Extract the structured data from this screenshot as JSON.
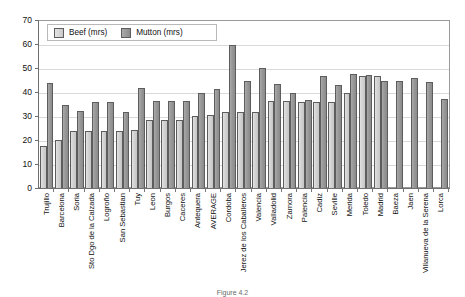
{
  "chart_data": {
    "type": "bar",
    "title": "",
    "subtitle": "",
    "xlabel": "",
    "ylabel": "",
    "ylim": [
      0,
      70
    ],
    "ytick_step": 10,
    "yticks": [
      70,
      60,
      50,
      40,
      30,
      20,
      10,
      0
    ],
    "grid": true,
    "legend_position": "top-left inside plot",
    "categories": [
      "Trujillo",
      "Barcelona",
      "Soria",
      "Sto Dgo de la Calzada",
      "Logroño",
      "San Sebastian",
      "Tuy",
      "Leon",
      "Burgos",
      "Caceres",
      "Antequera",
      "AVERAGE",
      "Cordoba",
      "Jerez de los Caballeros",
      "Valencia",
      "Valladolid",
      "Zamora",
      "Palencia",
      "Cadiz",
      "Seville",
      "Merida",
      "Toledo",
      "Madrid",
      "Baeza",
      "Jaen",
      "Villanueva de la Serena",
      "Lorca"
    ],
    "series": [
      {
        "name": "Beef (mrs)",
        "color": "#d0d0d0",
        "values": [
          17.5,
          20.0,
          24.0,
          24.0,
          24.0,
          24.0,
          24.5,
          28.3,
          28.3,
          28.3,
          30.0,
          30.5,
          32.0,
          31.7,
          31.7,
          36.4,
          36.4,
          36.0,
          36.0,
          36.0,
          40.0,
          47.0,
          47.0,
          null,
          null,
          null,
          null
        ]
      },
      {
        "name": "Mutton (mrs)",
        "color": "#969696",
        "values": [
          44.0,
          35.0,
          32.2,
          36.2,
          36.2,
          32.0,
          42.0,
          36.3,
          36.3,
          36.3,
          39.7,
          41.3,
          60.0,
          45.0,
          50.5,
          43.5,
          40.0,
          37.0,
          47.0,
          43.0,
          48.0,
          47.5,
          44.7,
          44.7,
          46.0,
          44.5,
          37.5
        ]
      }
    ]
  },
  "legend": {
    "items": [
      {
        "label": "Beef (mrs)",
        "swatch_class": "beef"
      },
      {
        "label": "Mutton (mrs)",
        "swatch_class": "mutton"
      }
    ]
  },
  "caption": {
    "text": "Figure 4.2"
  }
}
